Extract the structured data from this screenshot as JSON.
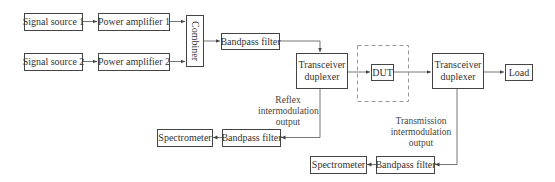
{
  "diagram": {
    "blocks": {
      "signal_source_1": "Signal source 1",
      "power_amplifier_1": "Power amplifier 1",
      "signal_source_2": "Signal source 2",
      "power_amplifier_2": "Power amplifier 2",
      "combiner": "Combiner",
      "bandpass_filter_tx": "Bandpass filter",
      "duplexer_left_line1": "Transceiver",
      "duplexer_left_line2": "duplexer",
      "dut": "DUT",
      "duplexer_right_line1": "Transceiver",
      "duplexer_right_line2": "duplexer",
      "load": "Load",
      "bandpass_filter_reflex": "Bandpass filter",
      "spectrometer_reflex": "Spectrometer",
      "bandpass_filter_trans": "Bandpass filter",
      "spectrometer_trans": "Spectrometer"
    },
    "labels": {
      "reflex": [
        "Reflex",
        "intermodulation",
        "output"
      ],
      "transmission": [
        "Transmission",
        "intermodulation",
        "output"
      ]
    },
    "colors": {
      "line": "#555555",
      "dashed_border": "#999999"
    }
  }
}
